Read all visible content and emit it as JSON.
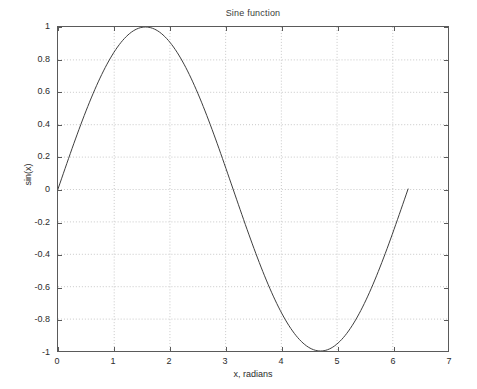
{
  "chart_data": {
    "type": "line",
    "title": "Sine function",
    "xlabel": "x, radians",
    "ylabel": "sin(x)",
    "xlim": [
      0,
      7
    ],
    "ylim": [
      -1,
      1
    ],
    "grid": true,
    "grid_style": "dotted",
    "grid_color": "#c8c8c8",
    "legend": null,
    "line_color": "#3c3c3c",
    "line_width": 1,
    "axis_color": "#5a5a5a",
    "background": "#ffffff",
    "xticks": [
      0,
      1,
      2,
      3,
      4,
      5,
      6,
      7
    ],
    "xtick_labels": [
      "0",
      "1",
      "2",
      "3",
      "4",
      "5",
      "6",
      "7"
    ],
    "yticks": [
      -1,
      -0.8,
      -0.6,
      -0.4,
      -0.2,
      0,
      0.2,
      0.4,
      0.6,
      0.8,
      1
    ],
    "ytick_labels": [
      "-1",
      "-0.8",
      "-0.6",
      "-0.4",
      "-0.2",
      "0",
      "0.2",
      "0.4",
      "0.6",
      "0.8",
      "1"
    ],
    "series": [
      {
        "name": "sin(x)",
        "x_start": 0,
        "x_end": 6.2832,
        "samples": 200,
        "x": [
          0,
          0.3142,
          0.6283,
          0.9425,
          1.2566,
          1.5708,
          1.885,
          2.1991,
          2.5133,
          2.8274,
          3.1416,
          3.4558,
          3.7699,
          4.0841,
          4.3982,
          4.7124,
          5.0265,
          5.3407,
          5.6549,
          5.969,
          6.2832
        ],
        "values": [
          0,
          0.309,
          0.5878,
          0.809,
          0.9511,
          1,
          0.9511,
          0.809,
          0.5878,
          0.309,
          0,
          -0.309,
          -0.5878,
          -0.809,
          -0.9511,
          -1,
          -0.9511,
          -0.809,
          -0.5878,
          -0.309,
          0
        ]
      }
    ],
    "annotations": {
      "maximum": {
        "x": 1.5708,
        "y": 1
      },
      "minimum": {
        "x": 4.7124,
        "y": -1
      },
      "zero_crossings": [
        0,
        3.1416,
        6.2832
      ]
    }
  }
}
